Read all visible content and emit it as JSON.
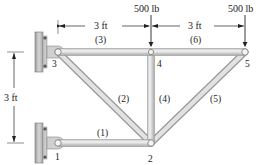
{
  "figure": {
    "colors": {
      "member_fill": "#d9d9d9",
      "member_edge": "#9a9a9a",
      "wall_fill": "#b8b8b8",
      "text": "#222222",
      "background": "#ffffff"
    }
  },
  "joints": [
    {
      "id": "1",
      "label": "1",
      "x": 58,
      "y": 143
    },
    {
      "id": "2",
      "label": "2",
      "x": 151,
      "y": 143
    },
    {
      "id": "3",
      "label": "3",
      "x": 58,
      "y": 52
    },
    {
      "id": "4",
      "label": "4",
      "x": 151,
      "y": 52
    },
    {
      "id": "5",
      "label": "5",
      "x": 245,
      "y": 52
    }
  ],
  "members": [
    {
      "id": "1",
      "label": "(1)",
      "from": "1",
      "to": "2"
    },
    {
      "id": "2",
      "label": "(2)",
      "from": "3",
      "to": "2"
    },
    {
      "id": "3",
      "label": "(3)",
      "from": "3",
      "to": "4"
    },
    {
      "id": "4",
      "label": "(4)",
      "from": "4",
      "to": "2"
    },
    {
      "id": "5",
      "label": "(5)",
      "from": "5",
      "to": "2"
    },
    {
      "id": "6",
      "label": "(6)",
      "from": "4",
      "to": "5"
    }
  ],
  "loads": [
    {
      "joint": "4",
      "label": "500 lb",
      "direction": "down"
    },
    {
      "joint": "5",
      "label": "500 lb",
      "direction": "down"
    }
  ],
  "dimensions": [
    {
      "id": "span-3-4",
      "label": "3 ft",
      "orientation": "horizontal",
      "between": [
        "3",
        "4"
      ]
    },
    {
      "id": "span-4-5",
      "label": "3 ft",
      "orientation": "horizontal",
      "between": [
        "4",
        "5"
      ]
    },
    {
      "id": "height-1-3",
      "label": "3 ft",
      "orientation": "vertical",
      "between": [
        "3",
        "1"
      ]
    }
  ],
  "supports": [
    {
      "joint": "3",
      "type": "wall-pin"
    },
    {
      "joint": "1",
      "type": "wall-pin"
    }
  ]
}
